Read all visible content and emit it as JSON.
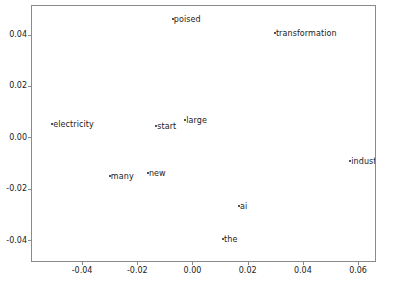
{
  "chart_data": {
    "type": "scatter",
    "title": "",
    "xlabel": "",
    "ylabel": "",
    "xlim": [
      -0.0585,
      0.0665
    ],
    "ylim": [
      -0.0485,
      0.0515
    ],
    "grid": false,
    "legend": null,
    "xticks": [
      "-0.04",
      "-0.02",
      "0.00",
      "0.02",
      "0.04",
      "0.06"
    ],
    "xtick_values": [
      -0.04,
      -0.02,
      0.0,
      0.02,
      0.04,
      0.06
    ],
    "yticks": [
      "0.04",
      "0.02",
      "0.00",
      "-0.02",
      "-0.04"
    ],
    "ytick_values": [
      0.04,
      0.02,
      0.0,
      -0.02,
      -0.04
    ],
    "point_labels": [
      "poised",
      "transformation",
      "electricity",
      "start",
      "large",
      "industries",
      "many",
      "new",
      "ai",
      "the"
    ],
    "points": [
      {
        "label": "poised",
        "x": -0.0075,
        "y": 0.0465
      },
      {
        "label": "transformation",
        "x": 0.0295,
        "y": 0.041
      },
      {
        "label": "electricity",
        "x": -0.0512,
        "y": 0.0055
      },
      {
        "label": "start",
        "x": -0.0135,
        "y": 0.005
      },
      {
        "label": "large",
        "x": -0.003,
        "y": 0.007
      },
      {
        "label": "industries",
        "x": 0.0568,
        "y": -0.009
      },
      {
        "label": "many",
        "x": -0.0303,
        "y": -0.0145
      },
      {
        "label": "new",
        "x": -0.0165,
        "y": -0.0135
      },
      {
        "label": "ai",
        "x": 0.0165,
        "y": -0.0262
      },
      {
        "label": "the",
        "x": 0.0107,
        "y": -0.039
      }
    ]
  },
  "colors": {
    "background": "#ffffff",
    "axis": "#8a8a8a",
    "text": "#1a1a1a",
    "marker": "#1a1a1a"
  }
}
